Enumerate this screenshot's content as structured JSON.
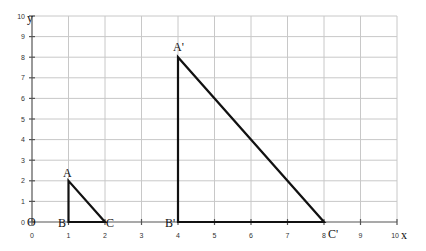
{
  "chart_data": {
    "type": "diagram-coordinate-grid",
    "title": "",
    "xlabel": "x",
    "ylabel": "y",
    "xlim": [
      0,
      10
    ],
    "ylim": [
      0,
      10
    ],
    "grid": true,
    "x_ticks": [
      "0",
      "1",
      "2",
      "3",
      "4",
      "5",
      "6",
      "7",
      "8",
      "9",
      "10"
    ],
    "y_ticks": [
      "0",
      "1",
      "2",
      "3",
      "4",
      "5",
      "6",
      "7",
      "8",
      "9",
      "10"
    ],
    "origin_label": "O",
    "shapes": [
      {
        "name": "triangle ABC",
        "points": [
          {
            "label": "A",
            "x": 1,
            "y": 2
          },
          {
            "label": "B",
            "x": 1,
            "y": 0
          },
          {
            "label": "C",
            "x": 2,
            "y": 0
          }
        ]
      },
      {
        "name": "triangle A'B'C'",
        "points": [
          {
            "label": "A'",
            "x": 4,
            "y": 8
          },
          {
            "label": "B'",
            "x": 4,
            "y": 0
          },
          {
            "label": "C'",
            "x": 8,
            "y": 0
          }
        ]
      }
    ]
  },
  "labels": {
    "x_axis": "x",
    "y_axis": "y",
    "origin": "O",
    "A": "A",
    "B": "B",
    "C": "C",
    "A_prime": "A'",
    "B_prime": "B'",
    "C_prime": "C'",
    "x_ticks": [
      "0",
      "1",
      "2",
      "3",
      "4",
      "5",
      "6",
      "7",
      "8",
      "9",
      "10"
    ],
    "y_ticks": [
      "0",
      "1",
      "2",
      "3",
      "4",
      "5",
      "6",
      "7",
      "8",
      "9",
      "10"
    ]
  }
}
